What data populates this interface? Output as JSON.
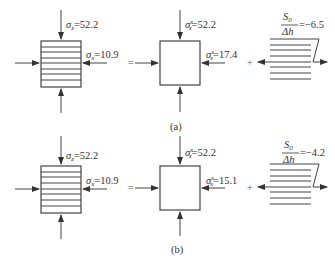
{
  "figure": {
    "panels": [
      {
        "id": "a",
        "caption": "(a)",
        "left_element": {
          "sigma_z_label": "σ",
          "sigma_z_sub": "z",
          "sigma_z_value": "=52.2",
          "sigma_x_label": "σ",
          "sigma_x_sub": "x",
          "sigma_x_value": "=10.9"
        },
        "equals": "=",
        "middle_element": {
          "sigma_z_label": "σ",
          "sigma_z_sub": "z",
          "sigma_z_sup": "s",
          "sigma_z_value": "=52.2",
          "sigma_x_label": "σ",
          "sigma_x_sub": "x",
          "sigma_x_sup": "s",
          "sigma_x_value": "=17.4"
        },
        "plus": "+",
        "right_element": {
          "numerator": "S",
          "numerator_sub": "0",
          "denominator": "Δh",
          "value": "=−6.5"
        }
      },
      {
        "id": "b",
        "caption": "(b)",
        "left_element": {
          "sigma_z_label": "σ",
          "sigma_z_sub": "z",
          "sigma_z_value": "=52.2",
          "sigma_x_label": "σ",
          "sigma_x_sub": "x",
          "sigma_x_value": "=10.9"
        },
        "equals": "=",
        "middle_element": {
          "sigma_z_label": "σ",
          "sigma_z_sub": "z",
          "sigma_z_sup": "s",
          "sigma_z_value": "=52.2",
          "sigma_x_label": "σ",
          "sigma_x_sub": "x",
          "sigma_x_sup": "s",
          "sigma_x_value": "=15.1"
        },
        "plus": "+",
        "right_element": {
          "numerator": "S",
          "numerator_sub": "0",
          "denominator": "Δh",
          "value": "=−4.2"
        }
      }
    ]
  }
}
